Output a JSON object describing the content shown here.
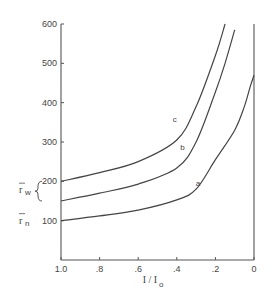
{
  "chart_data": {
    "type": "line",
    "title": "",
    "xlabel": "I/I0",
    "xlabel_main": "I / I",
    "xlabel_sub": "o",
    "ylabel": "",
    "xlim": [
      1.0,
      0.0
    ],
    "ylim": [
      0,
      600
    ],
    "x_reversed": true,
    "grid": false,
    "legend": "inline labels on curves",
    "x_ticks": [
      1.0,
      0.8,
      0.6,
      0.4,
      0.2,
      0.0
    ],
    "x_tick_labels": [
      "1.0",
      ".8",
      ".6",
      ".4",
      ".2",
      "0"
    ],
    "y_ticks": [
      100,
      200,
      300,
      400,
      500,
      600
    ],
    "y_tick_labels": [
      "100",
      "200",
      "300",
      "400",
      "500",
      "600"
    ],
    "side_annotations": [
      {
        "text": "r̄w",
        "main": "r",
        "sub": "w",
        "value_range": [
          150,
          200
        ],
        "brace": true
      },
      {
        "text": "r̄n",
        "main": "r",
        "sub": "n",
        "value": 100
      }
    ],
    "series": [
      {
        "name": "a",
        "x": [
          1.0,
          0.8,
          0.6,
          0.4,
          0.3,
          0.2,
          0.1,
          0.05,
          0.02,
          0.0
        ],
        "y": [
          100,
          112,
          127,
          153,
          180,
          255,
          330,
          390,
          440,
          470
        ]
      },
      {
        "name": "b",
        "x": [
          1.0,
          0.8,
          0.6,
          0.4,
          0.3,
          0.2,
          0.15,
          0.1
        ],
        "y": [
          150,
          170,
          193,
          234,
          300,
          427,
          500,
          585
        ]
      },
      {
        "name": "c",
        "x": [
          1.0,
          0.8,
          0.6,
          0.4,
          0.3,
          0.2,
          0.15
        ],
        "y": [
          200,
          222,
          250,
          305,
          390,
          520,
          600
        ]
      }
    ],
    "curve_label_positions": [
      {
        "name": "a",
        "x": 0.29,
        "y": 188
      },
      {
        "name": "b",
        "x": 0.37,
        "y": 280
      },
      {
        "name": "c",
        "x": 0.41,
        "y": 350
      }
    ]
  }
}
